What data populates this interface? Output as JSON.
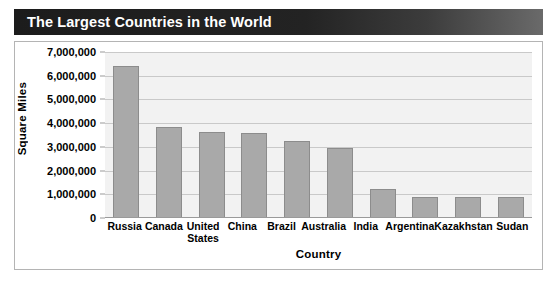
{
  "title": "The Largest Countries in the World",
  "colors": {
    "title_bar_dark": "#1c1c1c",
    "title_text": "#ffffff",
    "bar_fill": "#a9a9a9",
    "bar_border": "#8c8c8c",
    "plot_background": "#f2f2f2",
    "gridline": "#c9c9c9",
    "frame_border": "#b4b4b4"
  },
  "chart_data": {
    "type": "bar",
    "title": "The Largest Countries in the World",
    "xlabel": "Country",
    "ylabel": "Square Miles",
    "categories": [
      "Russia",
      "Canada",
      "United States",
      "China",
      "Brazil",
      "Australia",
      "India",
      "Argentina",
      "Kazakhstan",
      "Sudan"
    ],
    "values": [
      6400000,
      3850000,
      3620000,
      3600000,
      3250000,
      2950000,
      1220000,
      900000,
      900000,
      900000
    ],
    "ylim": [
      0,
      7000000
    ],
    "ytick_labels": [
      "7,000,000",
      "6,000,000",
      "5,000,000",
      "4,000,000",
      "3,000,000",
      "2,000,000",
      "1,000,000",
      "0"
    ],
    "ytick_values": [
      7000000,
      6000000,
      5000000,
      4000000,
      3000000,
      2000000,
      1000000,
      0
    ],
    "grid": true,
    "legend": false
  }
}
